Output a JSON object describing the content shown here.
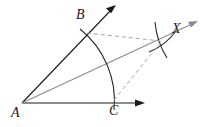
{
  "figure": {
    "kind": "geometry-construction",
    "background_color": "#ffffff",
    "width": 203,
    "height": 127,
    "labels": {
      "A": "A",
      "B": "B",
      "C": "C",
      "X": "X"
    },
    "colors": {
      "stroke": "#1a1a1a",
      "bisector": "#8c8c8c",
      "dashed": "#a6a6a6",
      "arc": "#2b2b2b"
    },
    "points": {
      "A": {
        "x": 22,
        "y": 103
      },
      "B": {
        "x": 85,
        "y": 35
      },
      "C": {
        "x": 113,
        "y": 103
      },
      "X": {
        "x": 163,
        "y": 40
      }
    },
    "rays": [
      {
        "name": "ray-AB",
        "from": "A",
        "through": "B",
        "tip_x": 116,
        "tip_y": 5,
        "style": "solid",
        "color": "#1a1a1a",
        "arrow": true
      },
      {
        "name": "ray-AC",
        "from": "A",
        "through": "C",
        "tip_x": 145,
        "tip_y": 103,
        "style": "solid",
        "color": "#1a1a1a",
        "arrow": true
      },
      {
        "name": "ray-bisector-AX",
        "from": "A",
        "through": "X",
        "tip_x": 198,
        "tip_y": 21,
        "style": "solid",
        "color": "#8c8c8c",
        "arrow": true
      }
    ],
    "arcs": [
      {
        "name": "arc-BC",
        "center": "A",
        "from": "B",
        "to": "C",
        "style": "solid",
        "color": "#2b2b2b"
      },
      {
        "name": "arc-from-B",
        "center": "B",
        "near": "X",
        "style": "solid",
        "color": "#2b2b2b"
      },
      {
        "name": "arc-from-C",
        "center": "C",
        "near": "X",
        "style": "solid",
        "color": "#2b2b2b"
      }
    ],
    "dashed_segments": [
      {
        "name": "dashed-B-to-X",
        "from": "B",
        "to": "X",
        "color": "#a6a6a6"
      },
      {
        "name": "dashed-C-to-X",
        "from": "C",
        "to": "X",
        "color": "#a6a6a6"
      }
    ]
  }
}
